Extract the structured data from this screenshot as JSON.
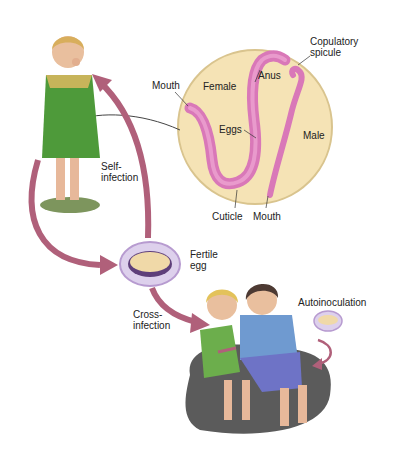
{
  "diagram": {
    "labels": {
      "copulatory_spicule": "Copulatory\nspicule",
      "mouth_female": "Mouth",
      "female": "Female",
      "anus": "Anus",
      "eggs": "Eggs",
      "male": "Male",
      "cuticle": "Cuticle",
      "mouth_male": "Mouth",
      "self_infection": "Self-\ninfection",
      "fertile_egg": "Fertile\negg",
      "cross_infection": "Cross-\ninfection",
      "autoinoculation": "Autoinoculation"
    },
    "colors": {
      "arrow": "#b0607a",
      "circle_fill": "#f5e3b5",
      "circle_border": "#d9c48e",
      "worm": "#d978b8",
      "egg_ring": "#b79bd0",
      "egg_core": "#f0d9a8",
      "dress": "#4e9a3a",
      "shirt": "#6f9ad0",
      "pants": "#6e73c6",
      "rock": "#5b5b5b"
    }
  }
}
